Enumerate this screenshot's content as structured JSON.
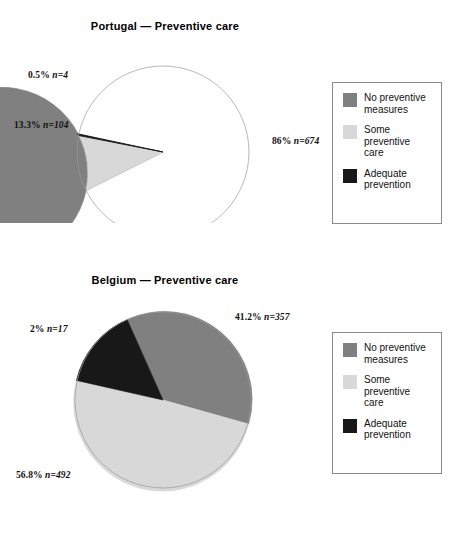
{
  "colors": {
    "no_preventive_measures": "#808080",
    "some_preventive_care": "#d8d8d8",
    "adequate_prevention": "#181818",
    "background": "#ffffff",
    "legend_border": "#8a8a8a",
    "text": "#111111"
  },
  "legend": {
    "items": [
      {
        "label": "No preventive\nmeasures",
        "color": "#808080",
        "key": "no-preventive-measures"
      },
      {
        "label": "Some\npreventive\ncare",
        "color": "#d8d8d8",
        "key": "some-preventive-care"
      },
      {
        "label": "Adequate\nprevention",
        "color": "#181818",
        "key": "adequate-prevention"
      }
    ]
  },
  "portugal": {
    "title": "Portugal — Preventive care",
    "labels": {
      "no_preventive_measures": "86%  n=674",
      "some_preventive_care": "13.3%  n=104",
      "adequate_prevention": "0.5%  n=4"
    }
  },
  "belgium": {
    "title": "Belgium — Preventive care",
    "labels": {
      "no_preventive_measures": "41.2%  n=357",
      "some_preventive_care": "56.8%  n=492",
      "adequate_prevention": "2%  n=17"
    }
  },
  "chart_data": [
    {
      "type": "pie",
      "title": "Portugal — Preventive care",
      "categories": [
        "No preventive measures",
        "Some preventive care",
        "Adequate prevention"
      ],
      "values": [
        86.0,
        13.3,
        0.5
      ],
      "counts": [
        674,
        104,
        4
      ],
      "unit": "%",
      "total_n": 782,
      "colors": [
        "#808080",
        "#d8d8d8",
        "#181818"
      ],
      "data_labels": [
        "86%  n=674",
        "13.3%  n=104",
        "0.5%  n=4"
      ],
      "legend_position": "right",
      "grid": false
    },
    {
      "type": "pie",
      "title": "Belgium — Preventive care",
      "categories": [
        "No preventive measures",
        "Some preventive care",
        "Adequate prevention"
      ],
      "values": [
        41.2,
        56.8,
        2.0
      ],
      "counts": [
        357,
        492,
        17
      ],
      "unit": "%",
      "total_n": 866,
      "colors": [
        "#808080",
        "#d8d8d8",
        "#181818"
      ],
      "data_labels": [
        "41.2%  n=357",
        "56.8%  n=492",
        "2%  n=17"
      ],
      "legend_position": "right",
      "grid": false
    }
  ]
}
